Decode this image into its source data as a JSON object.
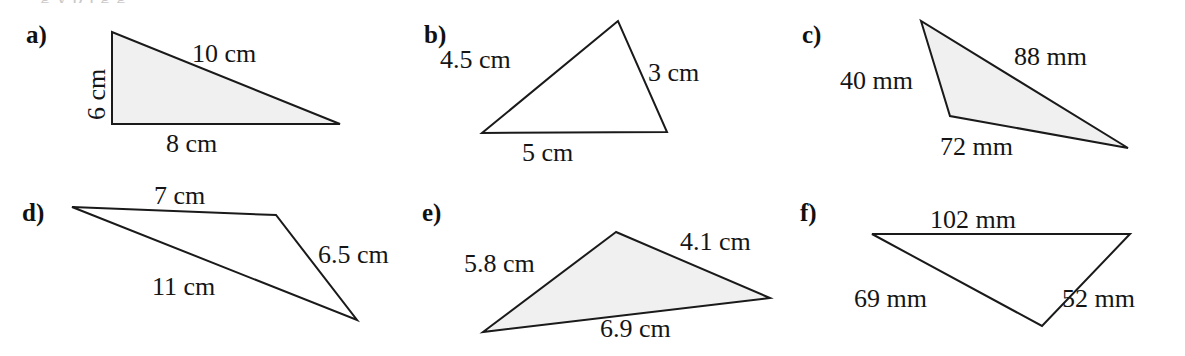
{
  "page": {
    "width": 1185,
    "height": 356,
    "background": "#ffffff",
    "ink_color": "#151515",
    "fill_color": "#f0f0f0",
    "partial_top_line": "g   y   p   j  g   g"
  },
  "panels": [
    {
      "id": "a",
      "letter": "a)",
      "shape": "right-triangle",
      "filled": true,
      "unit": "cm",
      "labels": [
        {
          "name": "side-vertical",
          "text": "6 cm",
          "orientation": "vertical"
        },
        {
          "name": "side-hypotenuse",
          "text": "10 cm",
          "orientation": "horizontal"
        },
        {
          "name": "side-base",
          "text": "8 cm",
          "orientation": "horizontal"
        }
      ],
      "points": "112,32 112,124 340,124"
    },
    {
      "id": "b",
      "letter": "b)",
      "shape": "triangle",
      "filled": false,
      "unit": "cm",
      "labels": [
        {
          "name": "side-left",
          "text": "4.5 cm",
          "orientation": "horizontal"
        },
        {
          "name": "side-right",
          "text": "3 cm",
          "orientation": "horizontal"
        },
        {
          "name": "side-base",
          "text": "5 cm",
          "orientation": "horizontal"
        }
      ],
      "points": "618,21 482,133 667,132"
    },
    {
      "id": "c",
      "letter": "c)",
      "shape": "triangle",
      "filled": true,
      "unit": "mm",
      "labels": [
        {
          "name": "side-left",
          "text": "40 mm",
          "orientation": "horizontal"
        },
        {
          "name": "side-top",
          "text": "88 mm",
          "orientation": "horizontal"
        },
        {
          "name": "side-base",
          "text": "72 mm",
          "orientation": "horizontal"
        }
      ],
      "points": "921,21 950,116 1128,148"
    },
    {
      "id": "d",
      "letter": "d)",
      "shape": "triangle",
      "filled": false,
      "unit": "cm",
      "labels": [
        {
          "name": "side-top",
          "text": "7 cm",
          "orientation": "horizontal"
        },
        {
          "name": "side-right",
          "text": "6.5 cm",
          "orientation": "horizontal"
        },
        {
          "name": "side-long",
          "text": "11 cm",
          "orientation": "horizontal"
        }
      ],
      "points": "72,207 276,215 357,320"
    },
    {
      "id": "e",
      "letter": "e)",
      "shape": "triangle",
      "filled": true,
      "unit": "cm",
      "labels": [
        {
          "name": "side-left",
          "text": "5.8 cm",
          "orientation": "horizontal"
        },
        {
          "name": "side-right",
          "text": "4.1 cm",
          "orientation": "horizontal"
        },
        {
          "name": "side-base",
          "text": "6.9 cm",
          "orientation": "horizontal"
        }
      ],
      "points": "616,232 483,332 770,298"
    },
    {
      "id": "f",
      "letter": "f)",
      "shape": "triangle",
      "filled": false,
      "unit": "mm",
      "labels": [
        {
          "name": "side-top",
          "text": "102 mm",
          "orientation": "horizontal"
        },
        {
          "name": "side-left",
          "text": "69 mm",
          "orientation": "horizontal"
        },
        {
          "name": "side-right",
          "text": "52 mm",
          "orientation": "horizontal"
        }
      ],
      "points": "872,234 1130,234 1042,326"
    }
  ]
}
